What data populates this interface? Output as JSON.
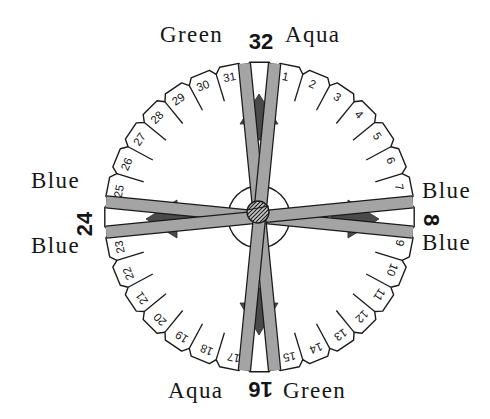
{
  "disk": {
    "slot_count": 32,
    "tab_numbers": [
      1,
      2,
      3,
      4,
      5,
      6,
      7,
      9,
      10,
      11,
      12,
      13,
      14,
      15,
      17,
      18,
      19,
      20,
      21,
      22,
      23,
      25,
      26,
      27,
      28,
      29,
      30,
      31
    ],
    "position_labels": {
      "top": "32",
      "right": "8",
      "bottom": "16",
      "left": "24"
    },
    "color_labels": {
      "top_left": "Green",
      "top_right": "Aqua",
      "left_upper": "Blue",
      "left_lower": "Blue",
      "right_upper": "Blue",
      "right_lower": "Blue",
      "bottom_left": "Aqua",
      "bottom_right": "Green"
    },
    "strands": [
      {
        "color_name": "Blue",
        "from_slit": [
          24,
          25
        ],
        "to_slit": [
          8,
          9
        ]
      },
      {
        "color_name": "Blue",
        "from_slit": [
          23,
          24
        ],
        "to_slit": [
          7,
          8
        ]
      },
      {
        "color_name": "Green",
        "from_slit": [
          31,
          32
        ],
        "to_slit": [
          15,
          16
        ]
      },
      {
        "color_name": "Aqua",
        "from_slit": [
          32,
          1
        ],
        "to_slit": [
          16,
          17
        ]
      }
    ],
    "arrows": [
      {
        "direction": "up"
      },
      {
        "direction": "down"
      },
      {
        "direction": "left"
      },
      {
        "direction": "right"
      }
    ],
    "colors": {
      "background": "#ffffff",
      "outline": "#1a1a1a",
      "strand_fill": "#a4a4a4",
      "arrow_fill": "#4a4a4a",
      "knot_fill": "#c6c6c6"
    }
  }
}
